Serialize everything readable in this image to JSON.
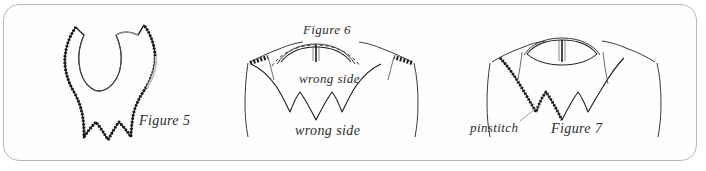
{
  "figure": {
    "kind": "sewing-illustration",
    "background_color": "#ffffff",
    "frame_color": "#b9b9bd",
    "ink_color": "#1a1a1a",
    "stitch_color": "#222222"
  },
  "captions": {
    "figure5": "Figure 5",
    "figure6": "Figure 6",
    "figure7": "Figure 7",
    "wrong_side_upper": "wrong side",
    "wrong_side_lower": "wrong side",
    "pinstitch": "pinstitch"
  },
  "panels": [
    {
      "id": "panel-figure-5",
      "caption": "Figure 5",
      "description": "Flat scalloped collar pattern piece with pinstitched outer edge and inner neckline curve"
    },
    {
      "id": "panel-figure-6",
      "caption": "Figure 6",
      "labels": [
        "wrong side",
        "wrong side"
      ],
      "description": "Bodice with collar pinned at shoulders, neckline dashed stitch line and center back slit"
    },
    {
      "id": "panel-figure-7",
      "caption": "Figure 7",
      "labels": [
        "pinstitch"
      ],
      "description": "Bodice with collar attached, pinstitch edge indicated by leader line"
    }
  ]
}
